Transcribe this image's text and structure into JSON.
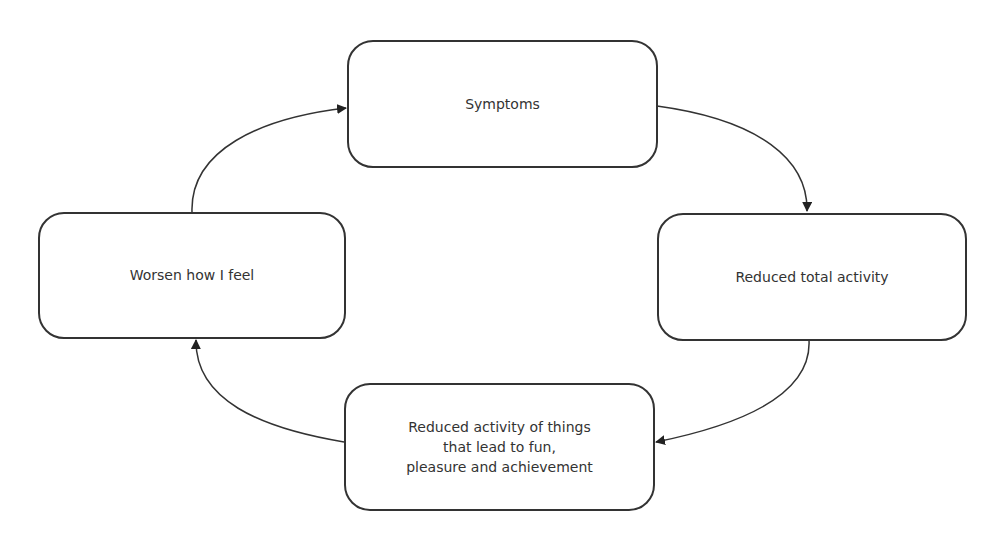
{
  "diagram": {
    "type": "cycle",
    "nodes": [
      {
        "id": "symptoms",
        "label": "Symptoms"
      },
      {
        "id": "reduced_total",
        "label": "Reduced total activity"
      },
      {
        "id": "reduced_fun",
        "label": "Reduced activity of things\nthat lead to fun,\npleasure and achievement"
      },
      {
        "id": "worsen",
        "label": "Worsen how I feel"
      }
    ],
    "edges": [
      {
        "from": "symptoms",
        "to": "reduced_total"
      },
      {
        "from": "reduced_total",
        "to": "reduced_fun"
      },
      {
        "from": "reduced_fun",
        "to": "worsen"
      },
      {
        "from": "worsen",
        "to": "symptoms"
      }
    ],
    "colors": {
      "stroke": "#333333",
      "background": "#ffffff"
    }
  }
}
